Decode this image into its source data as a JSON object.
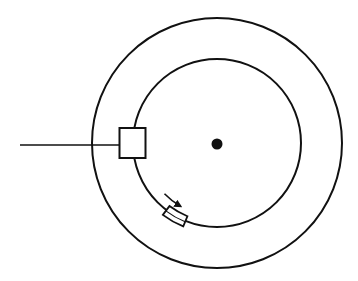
{
  "diagram": {
    "type": "rotating-disk-schematic",
    "colors": {
      "stroke": "#111111",
      "background": "#ffffff"
    },
    "outer_circle": {
      "cx": 217,
      "cy": 143,
      "r": 125
    },
    "inner_circle": {
      "cx": 217,
      "cy": 143,
      "r": 84
    },
    "center_dot": {
      "cx": 217,
      "cy": 144,
      "r": 5.5
    },
    "lead_line": {
      "x1": 20,
      "y1": 145,
      "x2": 119,
      "y2": 145
    },
    "square_block": {
      "x": 119.5,
      "y": 128,
      "w": 26,
      "h": 30
    },
    "arc_block": {
      "angle_start": 127,
      "angle_end": 112,
      "r_inner": 79,
      "r_outer": 90
    },
    "arrow": {
      "r": 73,
      "angle_start": 136,
      "angle_end": 120,
      "direction": "clockwise"
    }
  }
}
